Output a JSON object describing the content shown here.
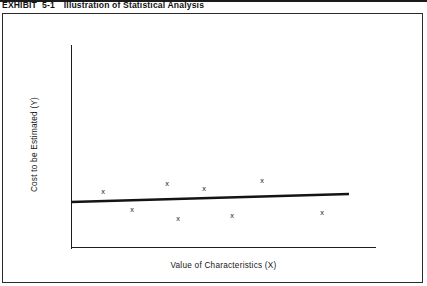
{
  "exhibit": {
    "label": "EXHIBIT",
    "number": "5-1",
    "title": "Illustration of Statistical Analysis"
  },
  "chart_data": {
    "type": "scatter",
    "title": "Illustration of Statistical Analysis",
    "xlabel": "Value of Characteristics (X)",
    "ylabel": "Cost to be Estimated (Y)",
    "grid": false,
    "legend": null,
    "axis_ticks": {
      "x": [],
      "y": []
    },
    "axes": {
      "x_line": {
        "x1": 71,
        "y1": 247,
        "x2": 376,
        "y2": 247
      },
      "y_line": {
        "x1": 71,
        "y1": 45,
        "x2": 71,
        "y2": 249
      }
    },
    "point_marker": "x",
    "points": [
      {
        "label": "x",
        "px": 103,
        "py": 191
      },
      {
        "label": "x",
        "px": 132,
        "py": 209
      },
      {
        "label": "x",
        "px": 167,
        "py": 183
      },
      {
        "label": "x",
        "px": 178,
        "py": 218
      },
      {
        "label": "x",
        "px": 204,
        "py": 188
      },
      {
        "label": "x",
        "px": 232,
        "py": 215
      },
      {
        "label": "x",
        "px": 262,
        "py": 180
      },
      {
        "label": "x",
        "px": 322,
        "py": 212
      }
    ],
    "trendline": {
      "kind": "regression-line",
      "x1": 71,
      "y1": 202,
      "x2": 349,
      "y2": 194,
      "width": 2.6,
      "color": "#141414"
    },
    "colors": {
      "ink": "#1a1a1a",
      "axis": "#1c1c1c",
      "frame": "#2b2b2b",
      "background": "#ffffff"
    }
  }
}
